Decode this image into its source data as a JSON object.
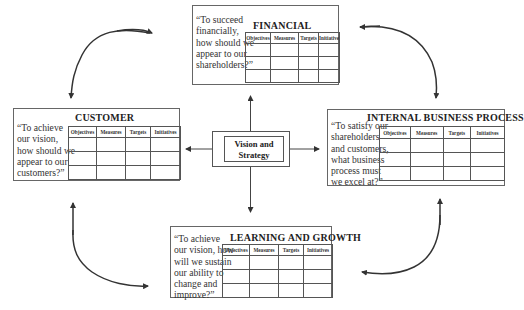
{
  "table_headers": [
    "Objectives",
    "Measures",
    "Targets",
    "Initiatives"
  ],
  "center": {
    "label_line1": "Vision and",
    "label_line2": "Strategy"
  },
  "perspectives": {
    "financial": {
      "title": "FINANCIAL",
      "quote": "“To succeed\nfinancially,\nhow should we\nappear to our\nshareholders?”",
      "rows": 3
    },
    "customer": {
      "title": "CUSTOMER",
      "quote": "“To achieve\nour vision,\nhow should we\nappear to our\ncustomers?”",
      "rows": 3
    },
    "internal_business_process": {
      "title": "INTERNAL BUSINESS PROCESS",
      "quote": "“To satisfy our\nshareholders\nand customers,\nwhat business\nprocess must\nwe excel at?”",
      "rows": 3
    },
    "learning_and_growth": {
      "title": "LEARNING AND GROWTH",
      "quote": "“To achieve\nour vision, how\nwill we sustain\nour ability to\nchange and\nimprove?”",
      "rows": 3
    }
  },
  "colors": {
    "line": "#333333",
    "border": "#555555",
    "text": "#222222"
  }
}
